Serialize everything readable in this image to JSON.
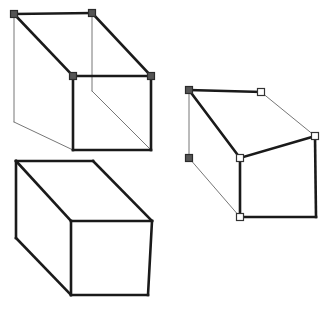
{
  "canvas": {
    "width": 326,
    "height": 311,
    "background": "#ffffff",
    "title": "Three rectangular boxes in oblique projection"
  },
  "style": {
    "edge_visible_color": "#1a1a1a",
    "edge_hidden_color": "#777777",
    "edge_visible_width": 2.6,
    "edge_hidden_width": 1.0,
    "edge_thin_color": "#555555",
    "marker_filled_fill": "#555555",
    "marker_filled_stroke": "#2b2b2b",
    "marker_hollow_fill": "#ffffff",
    "marker_hollow_stroke": "#333333",
    "marker_size": 7
  },
  "shapes": [
    {
      "id": "box-top-left",
      "name": "wireframe-box-upper-left",
      "kind": "wireframe-box",
      "vertices": {
        "back_top_left": [
          14,
          14
        ],
        "back_top_right": [
          92,
          13
        ],
        "front_top_right": [
          151,
          76
        ],
        "front_top_left": [
          73,
          76
        ],
        "back_bottom_left": [
          14,
          122
        ],
        "back_bottom_right": [
          92,
          91
        ],
        "front_bottom_right": [
          151,
          150
        ],
        "front_bottom_left": [
          73,
          150
        ]
      },
      "edges_visible": [
        [
          "back_top_left",
          "back_top_right"
        ],
        [
          "back_top_left",
          "front_top_left"
        ],
        [
          "front_top_left",
          "front_top_right"
        ],
        [
          "front_top_left",
          "front_bottom_left"
        ],
        [
          "front_top_right",
          "front_bottom_right"
        ],
        [
          "front_bottom_left",
          "front_bottom_right"
        ],
        [
          "back_top_right",
          "front_top_right"
        ]
      ],
      "edges_hidden": [
        [
          "back_top_left",
          "back_bottom_left"
        ],
        [
          "back_bottom_left",
          "front_bottom_left"
        ],
        [
          "back_top_right",
          "back_bottom_right"
        ],
        [
          "back_bottom_right",
          "front_bottom_right"
        ]
      ],
      "markers": [
        {
          "at": "back_top_left",
          "type": "filled"
        },
        {
          "at": "back_top_right",
          "type": "filled"
        },
        {
          "at": "front_top_left",
          "type": "filled"
        },
        {
          "at": "front_top_right",
          "type": "filled"
        }
      ]
    },
    {
      "id": "box-bottom-left",
      "name": "opaque-box-lower-left",
      "kind": "opaque-box",
      "vertices": {
        "back_top_left": [
          16,
          161
        ],
        "back_top_right": [
          93,
          161
        ],
        "front_top_right": [
          152,
          221
        ],
        "front_top_left": [
          71,
          221
        ],
        "back_bottom_left": [
          16,
          238
        ],
        "front_bottom_left": [
          71,
          295
        ],
        "front_bottom_right": [
          148,
          295
        ]
      },
      "edges_visible": [
        [
          "back_top_left",
          "back_top_right"
        ],
        [
          "back_top_right",
          "front_top_right"
        ],
        [
          "back_top_left",
          "front_top_left"
        ],
        [
          "front_top_left",
          "front_top_right"
        ],
        [
          "back_top_left",
          "back_bottom_left"
        ],
        [
          "back_bottom_left",
          "front_bottom_left"
        ],
        [
          "front_top_left",
          "front_bottom_left"
        ],
        [
          "front_top_right",
          "front_bottom_right"
        ],
        [
          "front_bottom_left",
          "front_bottom_right"
        ]
      ],
      "edges_hidden": [],
      "markers": []
    },
    {
      "id": "box-right",
      "name": "wireframe-box-right",
      "kind": "wireframe-box",
      "vertices": {
        "back_top_left": [
          189,
          90
        ],
        "back_top_right": [
          261,
          92
        ],
        "front_top_right": [
          315,
          136
        ],
        "front_top_left": [
          240,
          158
        ],
        "back_bottom_left": [
          189,
          158
        ],
        "front_bottom_left": [
          240,
          217
        ],
        "front_bottom_right": [
          316,
          217
        ]
      },
      "edges_visible": [
        [
          "back_top_left",
          "back_top_right"
        ],
        [
          "back_top_left",
          "front_top_left"
        ],
        [
          "front_top_left",
          "front_top_right"
        ],
        [
          "front_top_left",
          "front_bottom_left"
        ],
        [
          "front_top_right",
          "front_bottom_right"
        ],
        [
          "front_bottom_left",
          "front_bottom_right"
        ]
      ],
      "edges_hidden": [
        [
          "back_top_right",
          "front_top_right"
        ],
        [
          "back_top_left",
          "back_bottom_left"
        ],
        [
          "back_bottom_left",
          "front_bottom_left"
        ]
      ],
      "markers": [
        {
          "at": "back_top_left",
          "type": "filled"
        },
        {
          "at": "back_bottom_left",
          "type": "filled"
        },
        {
          "at": "back_top_right",
          "type": "hollow"
        },
        {
          "at": "front_top_right",
          "type": "hollow"
        },
        {
          "at": "front_top_left",
          "type": "hollow"
        },
        {
          "at": "front_bottom_left",
          "type": "hollow"
        }
      ]
    }
  ]
}
